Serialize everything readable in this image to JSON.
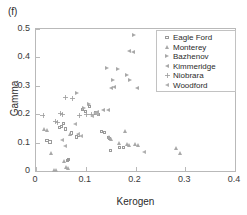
{
  "panel": {
    "label": "(f)"
  },
  "chart_data": {
    "type": "scatter",
    "title": "",
    "xlabel": "Kerogen",
    "ylabel": "Gamma",
    "xlim": [
      0,
      0.4
    ],
    "ylim": [
      0,
      0.5
    ],
    "xticks": [
      "0",
      "0.1",
      "0.2",
      "0.3",
      "0.4"
    ],
    "xtick_values": [
      0,
      0.1,
      0.2,
      0.3,
      0.4
    ],
    "yticks": [
      "0",
      "0.1",
      "0.2",
      "0.3",
      "0.4",
      "0.5"
    ],
    "ytick_values": [
      0,
      0.1,
      0.2,
      0.3,
      0.4,
      0.5
    ],
    "grid": false,
    "legend_position": "upper right",
    "series": [
      {
        "name": "Eagle Ford",
        "marker": "square",
        "points": [
          [
            0.022,
            0.106
          ],
          [
            0.028,
            0.102
          ],
          [
            0.047,
            0.152
          ],
          [
            0.052,
            0.158
          ],
          [
            0.056,
            0.168
          ],
          [
            0.06,
            0.148
          ],
          [
            0.063,
            0.038
          ],
          [
            0.066,
            0.04
          ],
          [
            0.072,
            0.134
          ],
          [
            0.081,
            0.12
          ],
          [
            0.086,
            0.125
          ],
          [
            0.093,
            0.216
          ],
          [
            0.099,
            0.21
          ],
          [
            0.108,
            0.228
          ],
          [
            0.12,
            0.204
          ],
          [
            0.126,
            0.198
          ],
          [
            0.132,
            0.14
          ],
          [
            0.138,
            0.136
          ],
          [
            0.145,
            0.118
          ],
          [
            0.148,
            0.114
          ],
          [
            0.15,
            0.072
          ],
          [
            0.168,
            0.082
          ],
          [
            0.176,
            0.084
          ]
        ]
      },
      {
        "name": "Monterey",
        "marker": "triangle-up",
        "points": [
          [
            0.016,
            0.146
          ],
          [
            0.022,
            0.142
          ],
          [
            0.03,
            0.062
          ],
          [
            0.036,
            0.004
          ],
          [
            0.04,
            0.002
          ],
          [
            0.058,
            0.036
          ],
          [
            0.062,
            0.014
          ],
          [
            0.065,
            0.01
          ],
          [
            0.07,
            0.128
          ],
          [
            0.148,
            0.118
          ],
          [
            0.152,
            0.113
          ],
          [
            0.168,
            0.098
          ],
          [
            0.18,
            0.14
          ],
          [
            0.184,
            0.096
          ],
          [
            0.188,
            0.092
          ],
          [
            0.2,
            0.096
          ],
          [
            0.205,
            0.092
          ],
          [
            0.282,
            0.08
          ],
          [
            0.29,
            0.062
          ]
        ]
      },
      {
        "name": "Bazhenov",
        "marker": "triangle-right",
        "points": [
          [
            0.082,
            0.272
          ],
          [
            0.096,
            0.22
          ],
          [
            0.106,
            0.236
          ],
          [
            0.142,
            0.36
          ],
          [
            0.165,
            0.358
          ],
          [
            0.182,
            0.336
          ],
          [
            0.188,
            0.318
          ],
          [
            0.196,
            0.476
          ],
          [
            0.155,
            0.32
          ]
        ]
      },
      {
        "name": "Kimmeridge",
        "marker": "triangle-left",
        "points": [
          [
            0.124,
            0.206
          ],
          [
            0.136,
            0.214
          ],
          [
            0.145,
            0.212
          ],
          [
            0.152,
            0.29
          ],
          [
            0.158,
            0.296
          ],
          [
            0.188,
            0.42
          ],
          [
            0.196,
            0.418
          ],
          [
            0.204,
            0.292
          ]
        ]
      },
      {
        "name": "Niobrara",
        "marker": "plus",
        "points": [
          [
            0.014,
            0.196
          ],
          [
            0.04,
            0.176
          ],
          [
            0.044,
            0.172
          ],
          [
            0.05,
            0.204
          ],
          [
            0.053,
            0.2
          ],
          [
            0.06,
            0.258
          ],
          [
            0.074,
            0.256
          ],
          [
            0.088,
            0.196
          ],
          [
            0.102,
            0.198
          ],
          [
            0.112,
            0.2
          ]
        ]
      },
      {
        "name": "Woodford",
        "marker": "triangle-left-2",
        "points": [
          [
            0.052,
            0.11
          ],
          [
            0.058,
            0.088
          ],
          [
            0.078,
            0.166
          ],
          [
            0.084,
            0.128
          ],
          [
            0.09,
            0.124
          ],
          [
            0.113,
            0.194
          ],
          [
            0.118,
            0.202
          ],
          [
            0.122,
            0.2
          ],
          [
            0.218,
            0.068
          ]
        ]
      }
    ]
  },
  "legend": {
    "entries": [
      {
        "label": "Eagle Ford",
        "marker": "square"
      },
      {
        "label": "Monterey",
        "marker": "triangle-up"
      },
      {
        "label": "Bazhenov",
        "marker": "triangle-right"
      },
      {
        "label": "Kimmeridge",
        "marker": "triangle-left"
      },
      {
        "label": "Niobrara",
        "marker": "plus"
      },
      {
        "label": "Woodford",
        "marker": "triangle-left-2"
      }
    ]
  }
}
